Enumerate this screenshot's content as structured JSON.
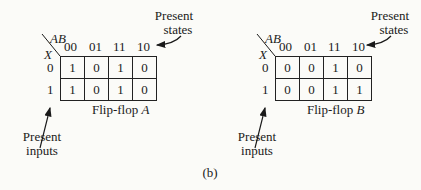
{
  "figure_label": "(b)",
  "maps": [
    {
      "title_prefix": "Flip-flop",
      "title_var": "A",
      "col_var": "AB",
      "row_var": "X",
      "columns": [
        "00",
        "01",
        "11",
        "10"
      ],
      "rows": [
        "0",
        "1"
      ],
      "cells": [
        [
          "1",
          "0",
          "1",
          "0"
        ],
        [
          "1",
          "0",
          "1",
          "0"
        ]
      ],
      "annotation_states": [
        "Present",
        "states"
      ],
      "annotation_inputs": [
        "Present",
        "inputs"
      ]
    },
    {
      "title_prefix": "Flip-flop",
      "title_var": "B",
      "col_var": "AB",
      "row_var": "X",
      "columns": [
        "00",
        "01",
        "11",
        "10"
      ],
      "rows": [
        "0",
        "1"
      ],
      "cells": [
        [
          "0",
          "0",
          "1",
          "0"
        ],
        [
          "0",
          "0",
          "1",
          "1"
        ]
      ],
      "annotation_states": [
        "Present",
        "states"
      ],
      "annotation_inputs": [
        "Present",
        "inputs"
      ]
    }
  ]
}
